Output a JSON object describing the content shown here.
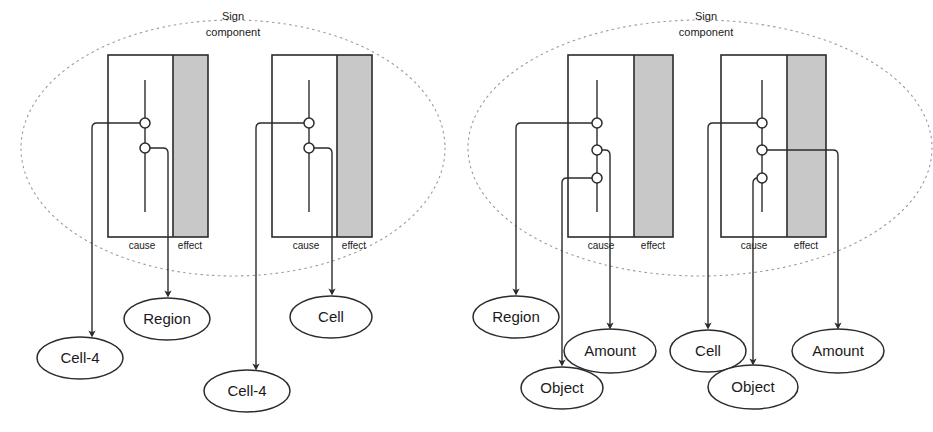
{
  "figure": {
    "background": "#ffffff",
    "line_color": "#2b2b2b",
    "shaded_fill": "#c8c8c8",
    "dotted_color": "#9a9a9a"
  },
  "groups": [
    {
      "id": "left-group",
      "title_line1": "Sign",
      "title_line2": "component",
      "boundary": {
        "cx": 233,
        "cy": 148,
        "rx": 212,
        "ry": 128
      },
      "components": [
        {
          "id": "left-component-1",
          "box": {
            "x": 108,
            "y": 55,
            "w": 100,
            "h": 182
          },
          "cause_label": "cause",
          "effect_label": "effect",
          "effect_band": {
            "x": 173,
            "w": 35
          },
          "ports": [
            {
              "id": "port-1",
              "cx": 145,
              "cy": 123
            },
            {
              "id": "port-2",
              "cx": 145,
              "cy": 148
            }
          ]
        },
        {
          "id": "left-component-2",
          "box": {
            "x": 272,
            "y": 55,
            "w": 100,
            "h": 182
          },
          "cause_label": "cause",
          "effect_label": "effect",
          "effect_band": {
            "x": 337,
            "w": 35
          },
          "ports": [
            {
              "id": "port-1",
              "cx": 309,
              "cy": 123
            },
            {
              "id": "port-2",
              "cx": 309,
              "cy": 148
            }
          ]
        }
      ],
      "nodes": [
        {
          "id": "node-cell-4-a",
          "label": "Cell-4",
          "cx": 80,
          "cy": 358,
          "rx": 43,
          "ry": 21
        },
        {
          "id": "node-region",
          "label": "Region",
          "cx": 167,
          "cy": 319,
          "rx": 43,
          "ry": 21
        },
        {
          "id": "node-cell-4-b",
          "label": "Cell-4",
          "cx": 247,
          "cy": 391,
          "rx": 43,
          "ry": 21
        },
        {
          "id": "node-cell",
          "label": "Cell",
          "cx": 331,
          "cy": 317,
          "rx": 41,
          "ry": 21
        }
      ]
    },
    {
      "id": "right-group",
      "title_line1": "Sign",
      "title_line2": "component",
      "boundary": {
        "cx": 700,
        "cy": 148,
        "rx": 232,
        "ry": 128
      },
      "components": [
        {
          "id": "right-component-1",
          "box": {
            "x": 568,
            "y": 55,
            "w": 105,
            "h": 182
          },
          "cause_label": "cause",
          "effect_label": "effect",
          "effect_band": {
            "x": 634,
            "w": 39
          },
          "ports": [
            {
              "id": "port-1",
              "cx": 597,
              "cy": 123
            },
            {
              "id": "port-2",
              "cx": 597,
              "cy": 150
            },
            {
              "id": "port-3",
              "cx": 597,
              "cy": 178
            }
          ]
        },
        {
          "id": "right-component-2",
          "box": {
            "x": 721,
            "y": 55,
            "w": 105,
            "h": 182
          },
          "cause_label": "cause",
          "effect_label": "effect",
          "effect_band": {
            "x": 787,
            "w": 39
          },
          "ports": [
            {
              "id": "port-1",
              "cx": 762,
              "cy": 123
            },
            {
              "id": "port-2",
              "cx": 762,
              "cy": 150
            },
            {
              "id": "port-3",
              "cx": 762,
              "cy": 178
            }
          ]
        }
      ],
      "nodes": [
        {
          "id": "node-region-r",
          "label": "Region",
          "cx": 516,
          "cy": 317,
          "rx": 43,
          "ry": 21
        },
        {
          "id": "node-object-a",
          "label": "Object",
          "cx": 562,
          "cy": 388,
          "rx": 41,
          "ry": 21
        },
        {
          "id": "node-amount-a",
          "label": "Amount",
          "cx": 610,
          "cy": 351,
          "rx": 46,
          "ry": 22
        },
        {
          "id": "node-cell-r",
          "label": "Cell",
          "cx": 708,
          "cy": 351,
          "rx": 38,
          "ry": 21
        },
        {
          "id": "node-object-b",
          "label": "Object",
          "cx": 753,
          "cy": 387,
          "rx": 45,
          "ry": 22
        },
        {
          "id": "node-amount-b",
          "label": "Amount",
          "cx": 838,
          "cy": 351,
          "rx": 46,
          "ry": 22
        }
      ]
    }
  ]
}
